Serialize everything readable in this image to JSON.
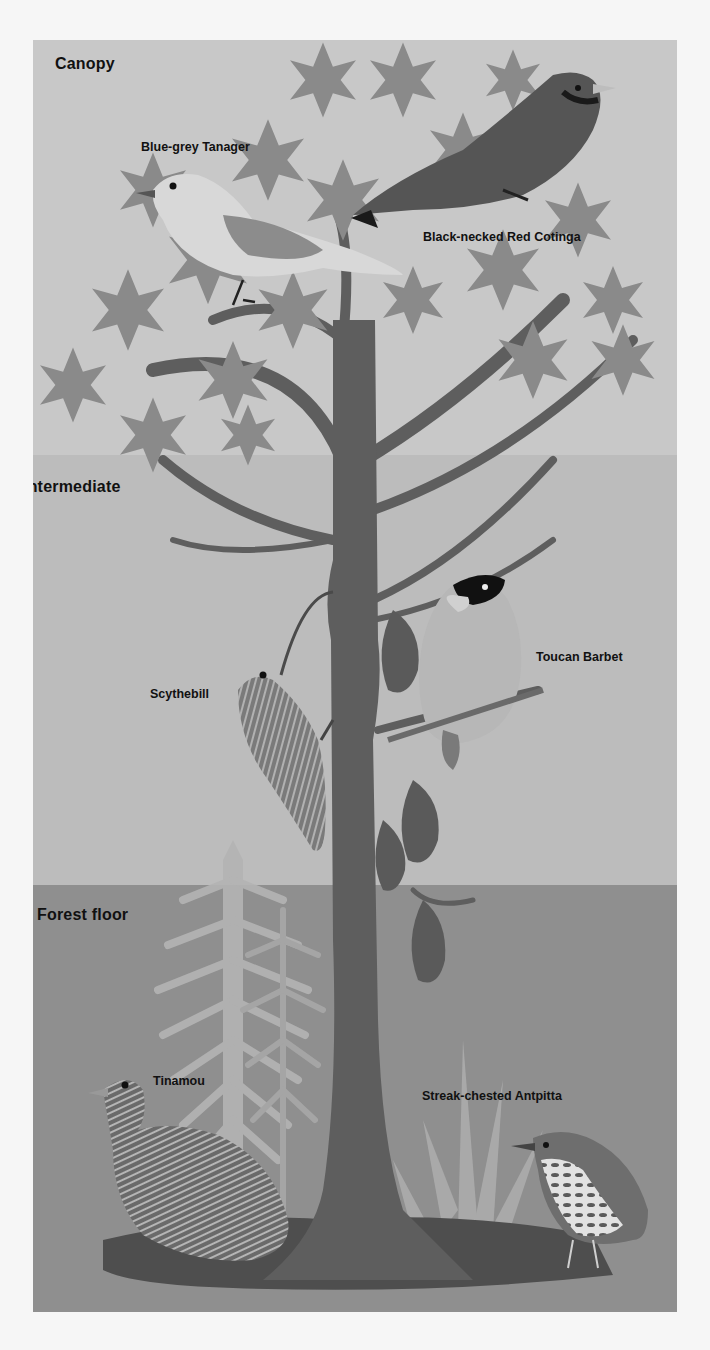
{
  "illustration": {
    "subject": "Rainforest bird layers",
    "zones": [
      {
        "name": "Canopy",
        "label": "Canopy",
        "shade": "#c8c8c8"
      },
      {
        "name": "Intermediate",
        "label": "Intermediate",
        "shade": "#bcbcbc"
      },
      {
        "name": "Forest floor",
        "label": "Forest floor",
        "shade": "#8f8f8f"
      }
    ],
    "species": [
      {
        "label": "Blue-grey Tanager",
        "zone": "Canopy"
      },
      {
        "label": "Black-necked Red Cotinga",
        "zone": "Canopy"
      },
      {
        "label": "Toucan Barbet",
        "zone": "Intermediate"
      },
      {
        "label": "Scythebill",
        "zone": "Intermediate"
      },
      {
        "label": "Tinamou",
        "zone": "Forest floor"
      },
      {
        "label": "Streak-chested Antpitta",
        "zone": "Forest floor"
      }
    ],
    "colors": {
      "page_background": "#f6f6f6",
      "foliage": "#8a8a8a",
      "trunk": "#5e5e5e",
      "ferns": "#b4b4b4",
      "ground_shadow": "#4e4e4e",
      "label_text": "#111111"
    }
  }
}
